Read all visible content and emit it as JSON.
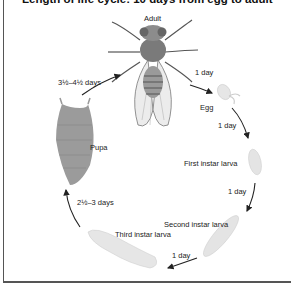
{
  "title": "Length of life cycle: 10 days from egg to adult",
  "stages": [
    {
      "name": "Adult",
      "icon": "adult-fly-icon"
    },
    {
      "name": "Egg",
      "icon": "egg-icon"
    },
    {
      "name": "First instar larva",
      "icon": "first-instar-larva-icon"
    },
    {
      "name": "Second instar larva",
      "icon": "second-instar-larva-icon"
    },
    {
      "name": "Third instar larva",
      "icon": "third-instar-larva-icon"
    },
    {
      "name": "Pupa",
      "icon": "pupa-icon"
    }
  ],
  "durations": {
    "adult_to_egg": "1 day",
    "egg_to_first": "1 day",
    "first_to_second": "1 day",
    "second_to_third": "1 day",
    "third_to_pupa": "2½–3 days",
    "pupa_to_adult": "3½–4½ days"
  },
  "colors": {
    "frame": "#555555",
    "arrow": "#222222",
    "pupa": "#9a9a9a",
    "larva": "#e2e2e2",
    "fly_body": "#8a8a8a"
  }
}
